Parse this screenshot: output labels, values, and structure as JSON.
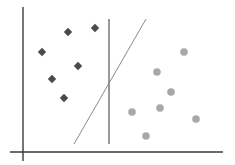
{
  "diagram": {
    "title": "",
    "colors": {
      "background": "#ffffff",
      "axis": "#3a3a3a",
      "vertical_boundary": "#555555",
      "diagonal_boundary": "#8a8a8a",
      "class_a": "#4a4a4a",
      "class_b": "#a8a8a8"
    },
    "axes": {
      "y_axis": {
        "x": 23,
        "y1": 7,
        "y2": 161
      },
      "x_axis": {
        "y": 152,
        "x1": 10,
        "x2": 223
      }
    },
    "boundaries": [
      {
        "name": "vertical-boundary",
        "x1": 109,
        "y1": 19,
        "x2": 109,
        "y2": 144
      },
      {
        "name": "diagonal-boundary",
        "x1": 74,
        "y1": 144,
        "x2": 146,
        "y2": 19
      }
    ],
    "class_a": {
      "label": "diamonds",
      "shape": "diamond",
      "points": [
        {
          "x": 68,
          "y": 32
        },
        {
          "x": 95,
          "y": 28
        },
        {
          "x": 42,
          "y": 52
        },
        {
          "x": 78,
          "y": 66
        },
        {
          "x": 52,
          "y": 79
        },
        {
          "x": 64,
          "y": 98
        }
      ]
    },
    "class_b": {
      "label": "circles",
      "shape": "circle",
      "points": [
        {
          "x": 184,
          "y": 52
        },
        {
          "x": 157,
          "y": 72
        },
        {
          "x": 171,
          "y": 92
        },
        {
          "x": 160,
          "y": 108
        },
        {
          "x": 132,
          "y": 112
        },
        {
          "x": 196,
          "y": 119
        },
        {
          "x": 146,
          "y": 136
        }
      ]
    }
  }
}
